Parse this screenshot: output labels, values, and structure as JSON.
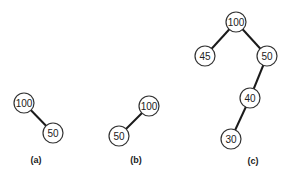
{
  "diagram": {
    "type": "binary-trees",
    "trees": [
      {
        "caption": "(a)",
        "nodes": [
          {
            "id": "a100",
            "label": "100",
            "x": 24,
            "y": 103
          },
          {
            "id": "a50",
            "label": "50",
            "x": 53,
            "y": 133
          }
        ],
        "edges": [
          [
            "a100",
            "a50"
          ]
        ],
        "caption_pos": {
          "x": 36,
          "y": 160
        }
      },
      {
        "caption": "(b)",
        "nodes": [
          {
            "id": "b100",
            "label": "100",
            "x": 149,
            "y": 106
          },
          {
            "id": "b50",
            "label": "50",
            "x": 119,
            "y": 136
          }
        ],
        "edges": [
          [
            "b100",
            "b50"
          ]
        ],
        "caption_pos": {
          "x": 136,
          "y": 160
        }
      },
      {
        "caption": "(c)",
        "nodes": [
          {
            "id": "c100",
            "label": "100",
            "x": 236,
            "y": 22
          },
          {
            "id": "c45",
            "label": "45",
            "x": 205,
            "y": 56
          },
          {
            "id": "c50",
            "label": "50",
            "x": 267,
            "y": 56
          },
          {
            "id": "c40",
            "label": "40",
            "x": 250,
            "y": 98
          },
          {
            "id": "c30",
            "label": "30",
            "x": 231,
            "y": 139
          }
        ],
        "edges": [
          [
            "c100",
            "c45"
          ],
          [
            "c100",
            "c50"
          ],
          [
            "c50",
            "c40"
          ],
          [
            "c40",
            "c30"
          ]
        ],
        "caption_pos": {
          "x": 253,
          "y": 161
        }
      }
    ],
    "node_radius": 10,
    "colors": {
      "edge": "#1a1a1a",
      "node_stroke": "#333333",
      "node_fill": "#ffffff",
      "text": "#222222"
    }
  }
}
